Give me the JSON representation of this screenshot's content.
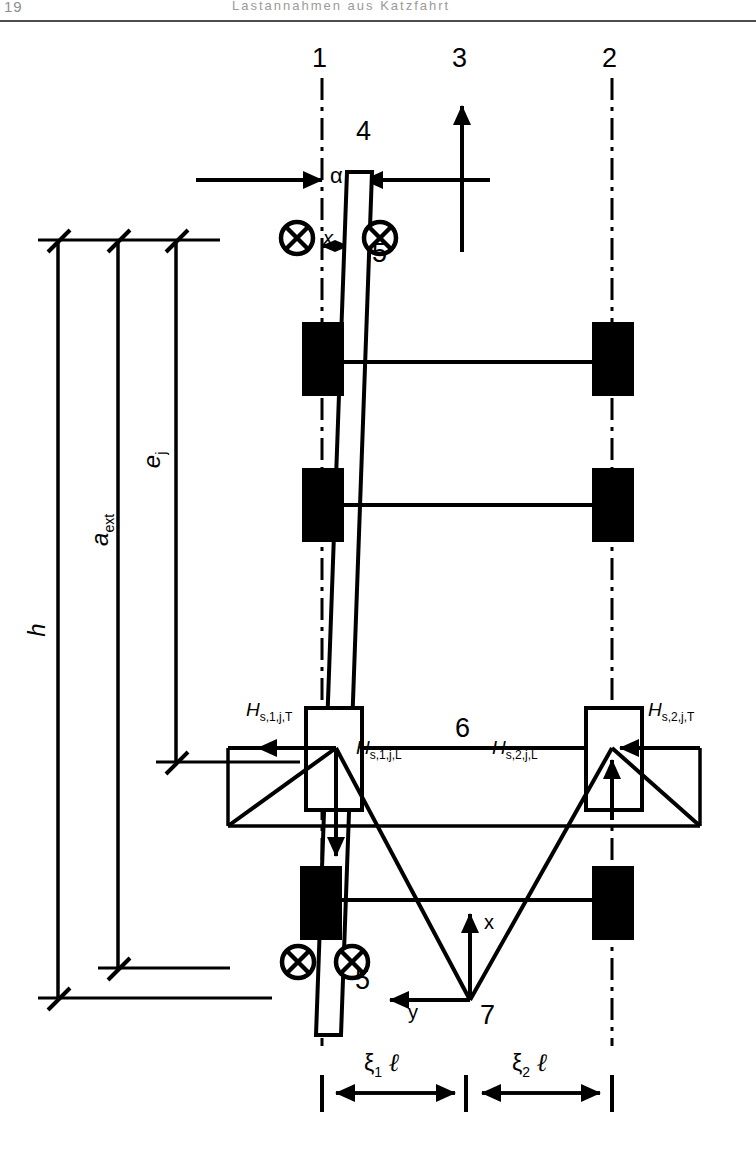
{
  "header": {
    "page_number": "19",
    "running_title": "Lastannahmen aus Katzfahrt"
  },
  "figure": {
    "callouts": [
      {
        "id": "1",
        "text": "1",
        "x": 312,
        "y": 45,
        "meaning": "rail-1-centerline"
      },
      {
        "id": "3",
        "text": "3",
        "x": 452,
        "y": 45,
        "meaning": "travel-direction-arrow"
      },
      {
        "id": "2",
        "text": "2",
        "x": 602,
        "y": 45,
        "meaning": "rail-2-centerline"
      },
      {
        "id": "4",
        "text": "4",
        "x": 356,
        "y": 118,
        "meaning": "skew-guide-member"
      },
      {
        "id": "5a",
        "text": "5",
        "x": 372,
        "y": 240,
        "meaning": "guide-roller-pair-top"
      },
      {
        "id": "5b",
        "text": "5",
        "x": 355,
        "y": 967,
        "meaning": "guide-roller-pair-bottom"
      },
      {
        "id": "6",
        "text": "6",
        "x": 455,
        "y": 715,
        "meaning": "crab-bridge-member"
      },
      {
        "id": "7",
        "text": "7",
        "x": 480,
        "y": 1002,
        "meaning": "origin-of-axes"
      }
    ],
    "angle_label": {
      "text": "α",
      "x": 330,
      "y": 165
    },
    "offset_label": {
      "text": "x",
      "x": 323,
      "y": 228
    },
    "axes": {
      "x_label": {
        "text": "x",
        "x": 484,
        "y": 912
      },
      "y_label": {
        "text": "y",
        "x": 408,
        "y": 1002
      }
    },
    "forces": [
      {
        "name": "H_s1jT",
        "base": "H",
        "sub": "s,1,j,T",
        "x": 246,
        "y": 702,
        "arrow": "left"
      },
      {
        "name": "H_s1jL",
        "base": "H",
        "sub": "s,1,j,L",
        "x": 356,
        "y": 738,
        "arrow": "down"
      },
      {
        "name": "H_s2jT",
        "base": "H",
        "sub": "s,2,j,T",
        "x": 632,
        "y": 702,
        "arrow": "left"
      },
      {
        "name": "H_s2jL",
        "base": "H",
        "sub": "s,2,j,L",
        "x": 522,
        "y": 738,
        "arrow": "up"
      }
    ],
    "vertical_dimensions": [
      {
        "name": "h",
        "label": "h",
        "x": 58,
        "y_top": 240,
        "y_bottom": 998,
        "label_y": 620
      },
      {
        "name": "a_ext",
        "label": "a",
        "sub": "ext",
        "x": 118,
        "y_top": 240,
        "y_bottom": 968,
        "label_y": 520
      },
      {
        "name": "e_j",
        "label": "e",
        "sub": "j",
        "x": 176,
        "y_top": 240,
        "y_bottom": 762,
        "label_y": 448
      }
    ],
    "horizontal_dimensions": [
      {
        "name": "xi1l",
        "label": "ξ",
        "sub": "1",
        "unit": "ℓ",
        "x_from": 322,
        "x_to": 466,
        "y": 1093,
        "label_x": 372,
        "label_y": 1058
      },
      {
        "name": "xi2l",
        "label": "ξ",
        "sub": "2",
        "unit": "ℓ",
        "x_from": 466,
        "x_to": 612,
        "y": 1093,
        "label_x": 518,
        "label_y": 1058
      }
    ]
  }
}
